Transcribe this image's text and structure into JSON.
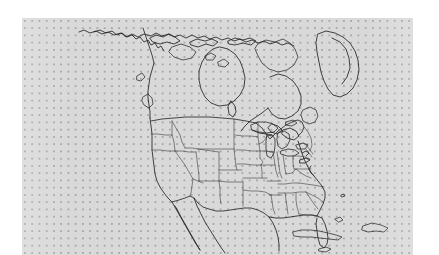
{
  "figure": {
    "kind": "reference-map",
    "title": "",
    "subtitle": "",
    "background_color": "#ffffff",
    "panel_color": "#d9d9d9",
    "grid_dot_color": "#a6a6a6",
    "line_color": "#232323",
    "state_line_color": "#3c3c3c"
  },
  "panel": {
    "left_px": 22,
    "top_px": 18,
    "width_px": 391,
    "height_px": 237,
    "grid": {
      "visible": true,
      "style": "dotted",
      "spacing_px": 7.25,
      "dot_size_px": 2
    }
  },
  "map_content": {
    "region": "North America",
    "projection_hint": "conic",
    "landmasses": [
      "Canada mainland",
      "Greenland (west edge)",
      "United States (contiguous)",
      "Mexico (northern)",
      "Baja California peninsula",
      "Newfoundland",
      "Cuba",
      "Hispaniola",
      "Bahamas",
      "Canadian Arctic Archipelago",
      "Vancouver Island",
      "Alaska panhandle"
    ],
    "water_features": [
      "Hudson Bay",
      "James Bay",
      "Great Lakes",
      "Gulf of Mexico",
      "Atlantic Ocean",
      "Pacific Ocean",
      "Gulf of California"
    ],
    "boundaries": {
      "national_visible": true,
      "state_province_visible": true,
      "state_lines_region": "contiguous United States"
    },
    "labels": [],
    "legend": {
      "visible": false,
      "entries": []
    },
    "scale_bar": {
      "visible": false
    },
    "north_arrow": {
      "visible": false
    }
  }
}
